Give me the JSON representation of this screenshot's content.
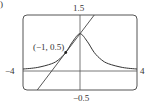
{
  "panel_label": ")",
  "chart_data": {
    "type": "line",
    "title": "",
    "xlabel": "",
    "ylabel": "",
    "xlim": [
      -4,
      4
    ],
    "ylim": [
      -0.5,
      1.5
    ],
    "grid": false,
    "tick_labels": {
      "x_left": "−4",
      "x_right": "4",
      "y_top": "1.5",
      "y_bottom": "−0.5"
    },
    "series": [
      {
        "name": "curve y = 1/(1+x^2)",
        "x": [
          -4,
          -3,
          -2,
          -1.5,
          -1,
          -0.5,
          0,
          0.5,
          1,
          1.5,
          2,
          3,
          4
        ],
        "values": [
          0.059,
          0.1,
          0.2,
          0.308,
          0.5,
          0.8,
          1.0,
          0.8,
          0.5,
          0.308,
          0.2,
          0.1,
          0.059
        ]
      },
      {
        "name": "tangent line y = 0.5x + 1",
        "x": [
          -3,
          1
        ],
        "values": [
          -0.5,
          1.5
        ]
      }
    ],
    "annotations": [
      {
        "text": "(−1, 0.5)",
        "x": -1,
        "y": 0.5,
        "marker": "point"
      }
    ]
  }
}
